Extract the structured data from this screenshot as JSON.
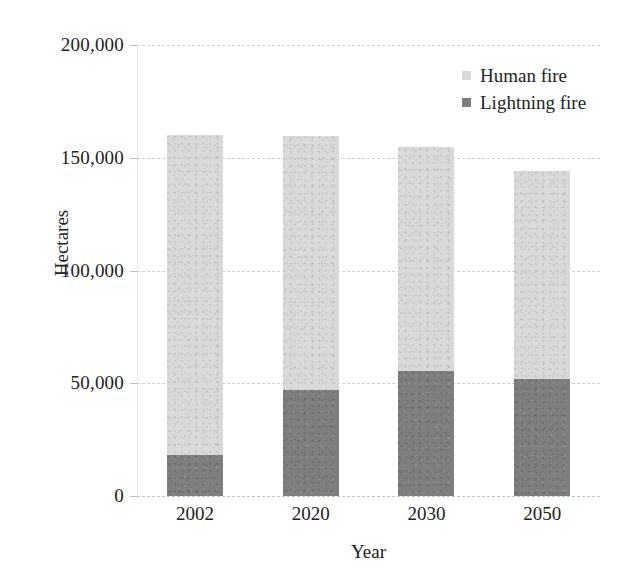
{
  "chart_data": {
    "type": "bar",
    "subtype": "stacked-vertical",
    "title": "",
    "xlabel": "Year",
    "ylabel": "Hectares",
    "categories": [
      "2002",
      "2020",
      "2030",
      "2050"
    ],
    "series": [
      {
        "name": "Lightning fire",
        "color": "#7e7e7e",
        "values": [
          18000,
          47000,
          55500,
          52000
        ]
      },
      {
        "name": "Human fire",
        "color": "#d9d9d9",
        "values": [
          142000,
          112500,
          99500,
          92000
        ]
      }
    ],
    "totals": [
      160000,
      159500,
      155000,
      144000
    ],
    "ylim": [
      0,
      200000
    ],
    "ytick_values": [
      0,
      50000,
      100000,
      150000,
      200000
    ],
    "ytick_labels": [
      "0",
      "50,000",
      "100,000",
      "150,000",
      "200,000"
    ],
    "grid": true,
    "grid_style": "dashed-horizontal",
    "legend_position": "top-right",
    "legend": [
      "Human fire",
      "Lightning fire"
    ]
  },
  "axes": {
    "y_title": "Hectares",
    "x_title": "Year",
    "y_ticks": [
      {
        "label": "200,000",
        "value": 200000
      },
      {
        "label": "150,000",
        "value": 150000
      },
      {
        "label": "100,000",
        "value": 100000
      },
      {
        "label": "50,000",
        "value": 50000
      },
      {
        "label": "0",
        "value": 0
      }
    ],
    "x_ticks": [
      {
        "label": "2002"
      },
      {
        "label": "2020"
      },
      {
        "label": "2030"
      },
      {
        "label": "2050"
      }
    ]
  },
  "legend": {
    "items": [
      {
        "label": "Human fire",
        "color": "#d9d9d9",
        "marker": "square-swatch-light"
      },
      {
        "label": "Lightning fire",
        "color": "#7e7e7e",
        "marker": "square-swatch-dark"
      }
    ]
  },
  "bars": [
    {
      "category": "2002",
      "human": 142000,
      "lightning": 18000,
      "total": 160000
    },
    {
      "category": "2020",
      "human": 112500,
      "lightning": 47000,
      "total": 159500
    },
    {
      "category": "2030",
      "human": 99500,
      "lightning": 55500,
      "total": 155000
    },
    {
      "category": "2050",
      "human": 92000,
      "lightning": 52000,
      "total": 144000
    }
  ],
  "colors": {
    "human_fire": "#d9d9d9",
    "lightning_fire": "#7e7e7e",
    "gridline": "#cfcfcf",
    "text": "#222222",
    "background": "#ffffff"
  }
}
